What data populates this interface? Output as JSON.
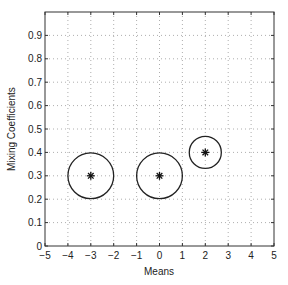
{
  "chart_data": {
    "type": "scatter",
    "title": "",
    "xlabel": "Means",
    "ylabel": "Mixing Coefficients",
    "xlim": [
      -5,
      5
    ],
    "ylim": [
      0,
      1
    ],
    "grid": true,
    "xticks": [
      "-5",
      "-4",
      "-3",
      "-2",
      "-1",
      "0",
      "1",
      "2",
      "3",
      "4",
      "5"
    ],
    "yticks": [
      "0",
      "0.1",
      "0.2",
      "0.3",
      "0.4",
      "0.5",
      "0.6",
      "0.7",
      "0.8",
      "0.9"
    ],
    "points": [
      {
        "x": -3,
        "y": 0.3,
        "radius": 1.0,
        "marker": "*"
      },
      {
        "x": 0,
        "y": 0.3,
        "radius": 1.0,
        "marker": "*"
      },
      {
        "x": 2,
        "y": 0.4,
        "radius": 0.7,
        "marker": "*"
      }
    ]
  }
}
